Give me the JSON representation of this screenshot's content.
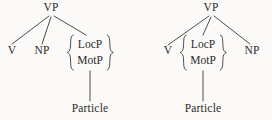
{
  "figure": {
    "type": "syntax-tree-pair",
    "background_color": "#fbfaf8",
    "ink_color": "#2b2b2b"
  },
  "trees": [
    {
      "id": "left",
      "root": {
        "label": "VP",
        "x": 51,
        "y": 8
      },
      "children": [
        {
          "label": "V",
          "x": 12,
          "y": 51
        },
        {
          "label": "NP",
          "x": 42,
          "y": 51
        },
        {
          "label": "braced-set",
          "x": 90,
          "y": 52,
          "set": [
            "LocP",
            "MotP"
          ],
          "brace_left": "{",
          "brace_right": "}",
          "child": {
            "label": "Particle",
            "x": 90,
            "y": 111
          }
        }
      ]
    },
    {
      "id": "right",
      "root": {
        "label": "VP",
        "x": 75,
        "y": 8
      },
      "children": [
        {
          "label": "V",
          "x": 32,
          "y": 51
        },
        {
          "label": "braced-set",
          "x": 67,
          "y": 52,
          "set": [
            "LocP",
            "MotP"
          ],
          "brace_left": "{",
          "brace_right": "}",
          "child": {
            "label": "Particle",
            "x": 67,
            "y": 111
          }
        },
        {
          "label": "NP",
          "x": 116,
          "y": 51
        }
      ]
    }
  ],
  "labels": {
    "vp": "VP",
    "v": "V",
    "np": "NP",
    "locp": "LocP",
    "motp": "MotP",
    "particle": "Particle",
    "brace_open": "{",
    "brace_close": "}"
  }
}
